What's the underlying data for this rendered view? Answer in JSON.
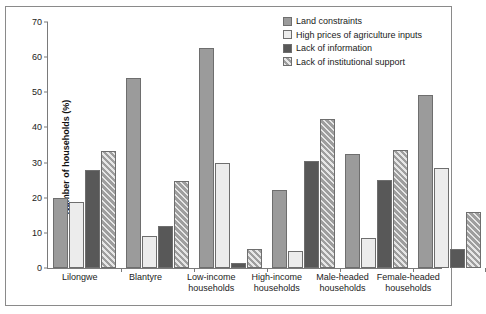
{
  "chart_data": {
    "type": "bar",
    "title": "",
    "xlabel": "",
    "ylabel": "Number of households (%)",
    "ylim": [
      0,
      70
    ],
    "yticks": [
      0,
      10,
      20,
      30,
      40,
      50,
      60,
      70
    ],
    "grid": false,
    "legend_position": "top-right",
    "categories": [
      "Lilongwe",
      "Blantyre",
      "Low-income households",
      "High-income households",
      "Male-headed households",
      "Female-headed households"
    ],
    "category_lines": [
      [
        "Lilongwe"
      ],
      [
        "Blantyre"
      ],
      [
        "Low-income",
        "households"
      ],
      [
        "High-income",
        "households"
      ],
      [
        "Male-headed",
        "households"
      ],
      [
        "Female-headed",
        "households"
      ]
    ],
    "series": [
      {
        "name": "Land  constraints",
        "color": "#9b9b9b",
        "pattern": "solid-gray",
        "values": [
          20.0,
          54.0,
          62.5,
          22.3,
          32.5,
          49.3
        ]
      },
      {
        "name": "High prices of agriculture inputs",
        "color": "#ececec",
        "pattern": "light-dotted",
        "values": [
          18.8,
          9.1,
          30.0,
          4.7,
          8.5,
          28.5
        ]
      },
      {
        "name": "Lack of information",
        "color": "#585858",
        "pattern": "solid-dark",
        "values": [
          28.0,
          12.0,
          1.5,
          30.5,
          25.0,
          5.5
        ]
      },
      {
        "name": "Lack of institutional support",
        "color": "#9e9e9e",
        "pattern": "diagonal-hatch",
        "values": [
          33.3,
          24.7,
          5.5,
          42.3,
          33.6,
          16.0
        ]
      }
    ]
  }
}
